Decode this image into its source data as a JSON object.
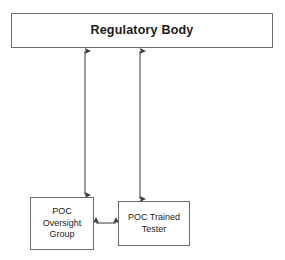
{
  "diagram": {
    "background_color": "#ffffff",
    "line_color": "#3a3a3a",
    "border_color": "#6b6b6b",
    "nodes": [
      {
        "id": "regulatory-body",
        "label": "Regulatory Body",
        "shape": "rectangle"
      },
      {
        "id": "poc-oversight-group",
        "label": "POC\nOversight\nGroup",
        "shape": "rectangle"
      },
      {
        "id": "poc-trained-tester",
        "label": "POC Trained\nTester",
        "shape": "rectangle"
      }
    ],
    "connectors": [
      {
        "id": "regulatory-to-oversight",
        "from": "regulatory-body",
        "to": "poc-oversight-group",
        "direction": "bidirectional",
        "orientation": "vertical"
      },
      {
        "id": "regulatory-to-tester",
        "from": "regulatory-body",
        "to": "poc-trained-tester",
        "direction": "bidirectional",
        "orientation": "vertical"
      },
      {
        "id": "oversight-to-tester",
        "from": "poc-oversight-group",
        "to": "poc-trained-tester",
        "direction": "bidirectional",
        "orientation": "horizontal"
      }
    ]
  }
}
